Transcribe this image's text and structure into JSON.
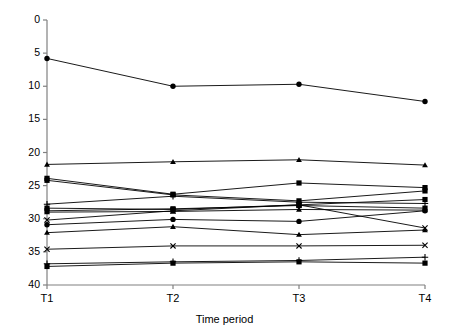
{
  "chart_data": {
    "type": "line",
    "title": "",
    "subtitle": "",
    "xlabel": "Time period",
    "ylabel": "Pulmonary vascular resistance index (Wood units)",
    "categories": [
      "T1",
      "T2",
      "T3",
      "T4"
    ],
    "x": [
      1,
      2,
      3,
      4
    ],
    "ylim": [
      0,
      40
    ],
    "yticks": [
      0,
      5,
      10,
      15,
      20,
      25,
      30,
      35,
      40
    ],
    "ytick_labels": [
      "0",
      "5",
      "10",
      "15",
      "20",
      "25",
      "30",
      "35",
      "40"
    ],
    "grid": false,
    "legend": "none",
    "legend_position": "none",
    "line_color": "#000000",
    "marker_color": "#000000",
    "background_color": "#ffffff",
    "axis_color": "#808080",
    "series": [
      {
        "name": "Patient 1",
        "marker": "circle",
        "values": [
          34.2,
          30.0,
          30.3,
          27.7
        ]
      },
      {
        "name": "Patient 2",
        "marker": "triangle",
        "values": [
          18.2,
          18.6,
          18.9,
          18.1
        ]
      },
      {
        "name": "Patient 3",
        "marker": "square",
        "values": [
          16.1,
          13.7,
          15.4,
          14.7
        ]
      },
      {
        "name": "Patient 4",
        "marker": "square",
        "values": [
          15.8,
          13.6,
          12.7,
          14.2
        ]
      },
      {
        "name": "Patient 5",
        "marker": "plus",
        "values": [
          12.2,
          13.4,
          12.5,
          12.3
        ]
      },
      {
        "name": "Patient 6",
        "marker": "square",
        "values": [
          11.6,
          11.4,
          12.1,
          12.9
        ]
      },
      {
        "name": "Patient 7",
        "marker": "square",
        "values": [
          11.2,
          11.5,
          12.0,
          11.6
        ]
      },
      {
        "name": "Patient 8",
        "marker": "triangle",
        "values": [
          11.0,
          11.1,
          11.4,
          11.3
        ]
      },
      {
        "name": "Patient 9",
        "marker": "x",
        "values": [
          9.8,
          11.2,
          12.1,
          8.6
        ]
      },
      {
        "name": "Patient 10",
        "marker": "circle",
        "values": [
          9.1,
          9.9,
          9.6,
          11.2
        ]
      },
      {
        "name": "Patient 11",
        "marker": "triangle",
        "values": [
          7.9,
          8.8,
          7.6,
          8.3
        ]
      },
      {
        "name": "Patient 12",
        "marker": "x",
        "values": [
          5.4,
          5.9,
          5.9,
          6.0
        ]
      },
      {
        "name": "Patient 13",
        "marker": "plus",
        "values": [
          3.2,
          3.5,
          3.7,
          4.2
        ]
      },
      {
        "name": "Patient 14",
        "marker": "square",
        "values": [
          2.8,
          3.3,
          3.5,
          3.3
        ]
      }
    ]
  },
  "axes": {
    "y_title": "Pulmonary vascular resistance index (Wood units)",
    "x_title": "Time period"
  },
  "xticks": [
    {
      "label": "T1"
    },
    {
      "label": "T2"
    },
    {
      "label": "T3"
    },
    {
      "label": "T4"
    }
  ],
  "yticks": [
    {
      "label": "40"
    },
    {
      "label": "35"
    },
    {
      "label": "30"
    },
    {
      "label": "25"
    },
    {
      "label": "20"
    },
    {
      "label": "15"
    },
    {
      "label": "10"
    },
    {
      "label": "5"
    },
    {
      "label": "0"
    }
  ]
}
